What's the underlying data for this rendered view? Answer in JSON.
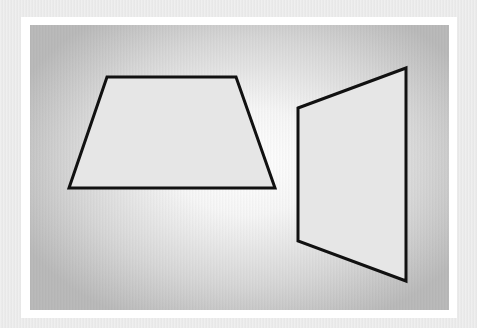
{
  "figure": {
    "shapes": [
      {
        "name": "trapezoid",
        "fill": "#e6e6e6",
        "stroke": "#111111"
      },
      {
        "name": "skewed-quadrilateral",
        "fill": "#e6e6e6",
        "stroke": "#111111"
      }
    ]
  }
}
